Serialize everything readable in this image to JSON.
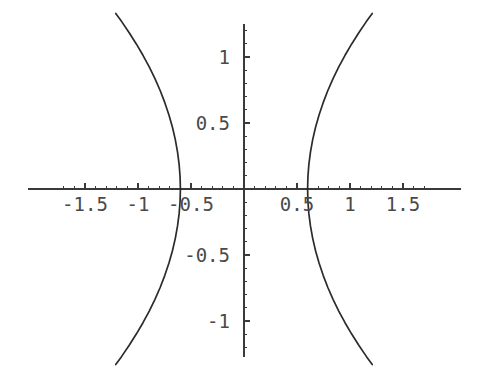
{
  "chart_data": {
    "type": "line",
    "title": "",
    "subtitle": "",
    "xlabel": "",
    "ylabel": "",
    "grid": false,
    "legend": false,
    "legend_position": "none",
    "style": "mathematica-default",
    "background_color": "#ffffff",
    "curve_color": "#2b2b2b",
    "axis_color": "#3a3a3a",
    "label_color": "#4a4a4a",
    "xlim": [
      -1.78,
      1.78
    ],
    "ylim": [
      -1.38,
      1.32
    ],
    "x_major_ticks": [
      -1.5,
      -1,
      -0.5,
      0.5,
      1,
      1.5
    ],
    "x_tick_labels": [
      "-1.5",
      "-1",
      "-0.5",
      "0.5",
      "1",
      "1.5"
    ],
    "y_major_ticks": [
      -1,
      -0.5,
      0.5,
      1
    ],
    "y_tick_labels": [
      "-1",
      "-0.5",
      "0.5",
      "1"
    ],
    "x_minor_tick_step": 0.1,
    "y_minor_tick_step": 0.1,
    "equation": "x^2/0.36 - y^2/0.81 = 1",
    "vertices": [
      -0.6,
      0.6
    ],
    "semi_axis_a": 0.6,
    "semi_axis_b": 0.9,
    "series": [
      {
        "name": "right-branch",
        "points": [
          [
            0.6,
            0.0
          ],
          [
            0.603,
            0.093
          ],
          [
            0.612,
            0.187
          ],
          [
            0.627,
            0.28
          ],
          [
            0.648,
            0.374
          ],
          [
            0.675,
            0.468
          ],
          [
            0.708,
            0.561
          ],
          [
            0.747,
            0.654
          ],
          [
            0.791,
            0.746
          ],
          [
            0.84,
            0.836
          ],
          [
            0.894,
            0.925
          ],
          [
            0.953,
            1.013
          ],
          [
            1.016,
            1.099
          ],
          [
            1.083,
            1.184
          ],
          [
            1.154,
            1.268
          ],
          [
            1.21,
            1.33
          ]
        ]
      },
      {
        "name": "right-branch-lower",
        "points": [
          [
            0.6,
            0.0
          ],
          [
            0.603,
            -0.093
          ],
          [
            0.612,
            -0.187
          ],
          [
            0.627,
            -0.28
          ],
          [
            0.648,
            -0.374
          ],
          [
            0.675,
            -0.468
          ],
          [
            0.708,
            -0.561
          ],
          [
            0.747,
            -0.654
          ],
          [
            0.791,
            -0.746
          ],
          [
            0.84,
            -0.836
          ],
          [
            0.894,
            -0.925
          ],
          [
            0.953,
            -1.013
          ],
          [
            1.016,
            -1.099
          ],
          [
            1.083,
            -1.184
          ],
          [
            1.154,
            -1.268
          ],
          [
            1.21,
            -1.33
          ]
        ]
      },
      {
        "name": "left-branch-upper",
        "points": [
          [
            -0.6,
            0.0
          ],
          [
            -0.603,
            0.093
          ],
          [
            -0.612,
            0.187
          ],
          [
            -0.627,
            0.28
          ],
          [
            -0.648,
            0.374
          ],
          [
            -0.675,
            0.468
          ],
          [
            -0.708,
            0.561
          ],
          [
            -0.747,
            0.654
          ],
          [
            -0.791,
            0.746
          ],
          [
            -0.84,
            0.836
          ],
          [
            -0.894,
            0.925
          ],
          [
            -0.953,
            1.013
          ],
          [
            -1.016,
            1.099
          ],
          [
            -1.083,
            1.184
          ],
          [
            -1.154,
            1.268
          ],
          [
            -1.21,
            1.33
          ]
        ]
      },
      {
        "name": "left-branch-lower",
        "points": [
          [
            -0.6,
            0.0
          ],
          [
            -0.603,
            -0.093
          ],
          [
            -0.612,
            -0.187
          ],
          [
            -0.627,
            -0.28
          ],
          [
            -0.648,
            -0.374
          ],
          [
            -0.675,
            -0.468
          ],
          [
            -0.708,
            -0.561
          ],
          [
            -0.747,
            -0.654
          ],
          [
            -0.791,
            -0.746
          ],
          [
            -0.84,
            -0.836
          ],
          [
            -0.894,
            -0.925
          ],
          [
            -0.953,
            -1.013
          ],
          [
            -1.016,
            -1.099
          ],
          [
            -1.083,
            -1.184
          ],
          [
            -1.154,
            -1.268
          ],
          [
            -1.21,
            -1.33
          ]
        ]
      }
    ]
  },
  "geometry": {
    "width": 487,
    "height": 379,
    "origin_x": 244,
    "origin_y": 189,
    "px_per_unit_x": 106,
    "px_per_unit_y": 132,
    "x_axis_left_px": 28,
    "x_axis_right_px": 461,
    "y_axis_top_px": 24,
    "y_axis_bottom_px": 357
  }
}
